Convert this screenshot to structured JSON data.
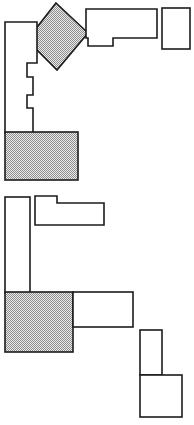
{
  "diagram": {
    "type": "line-drawing",
    "width": 194,
    "height": 425,
    "background_color": "#ffffff",
    "stroke_color": "#1c1c1c",
    "stroke_width": 1.6,
    "fill_style": "dither-hatch",
    "fill_color": "#9a9a9a",
    "fill_background": "#e8e8e8",
    "groups": [
      {
        "name": "upper-cluster",
        "label": "Upper assembly",
        "shapes": [
          {
            "name": "rotated-hatched-square",
            "label": "Rotated filled square",
            "fill": "hatched",
            "kind": "polygon",
            "points": "56,3 88,33 57,70 27,40"
          },
          {
            "name": "left-stepped-outline",
            "label": "Left stepped wall outline",
            "fill": "outline",
            "kind": "polygon",
            "points": "5,22 37,22 37,63 27,63 27,77 33,77 33,95 27,95 27,108 33,108 33,133 5,133"
          },
          {
            "name": "top-notched-rectangle",
            "label": "Top notched rectangle",
            "fill": "outline",
            "kind": "polygon",
            "points": "86,9 157,9 157,38 113,38 113,46 88,46 88,38 86,38"
          },
          {
            "name": "top-right-box",
            "label": "Top right box",
            "fill": "outline",
            "kind": "rect",
            "x": 162,
            "y": 8,
            "width": 28,
            "height": 41
          },
          {
            "name": "upper-hatched-rectangle",
            "label": "Upper filled rectangle",
            "fill": "hatched",
            "kind": "rect",
            "x": 5,
            "y": 132,
            "width": 73,
            "height": 48
          }
        ]
      },
      {
        "name": "lower-cluster",
        "label": "Lower assembly",
        "shapes": [
          {
            "name": "left-vertical-bar",
            "label": "Left vertical bar",
            "fill": "outline",
            "kind": "rect",
            "x": 5,
            "y": 197,
            "width": 25,
            "height": 96
          },
          {
            "name": "upper-L-shape",
            "label": "Upper L shaped outline",
            "fill": "outline",
            "kind": "polygon",
            "points": "35,196 57,196 57,203 104,203 104,225 35,225"
          },
          {
            "name": "lower-hatched-square",
            "label": "Lower filled square",
            "fill": "hatched",
            "kind": "rect",
            "x": 5,
            "y": 292,
            "width": 68,
            "height": 60
          },
          {
            "name": "mid-right-rectangle",
            "label": "Middle right rectangle",
            "fill": "outline",
            "kind": "rect",
            "x": 73,
            "y": 292,
            "width": 60,
            "height": 35
          },
          {
            "name": "bottom-right-narrow-box",
            "label": "Bottom right narrow box",
            "fill": "outline",
            "kind": "rect",
            "x": 140,
            "y": 330,
            "width": 22,
            "height": 45
          },
          {
            "name": "bottom-right-wide-box",
            "label": "Bottom right wide box",
            "fill": "outline",
            "kind": "rect",
            "x": 140,
            "y": 375,
            "width": 42,
            "height": 42
          }
        ]
      }
    ]
  }
}
